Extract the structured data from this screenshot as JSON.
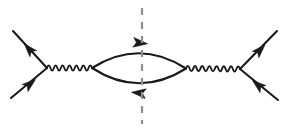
{
  "figure": {
    "width": 291,
    "height": 131,
    "background_color": "#ffffff",
    "line_color": "#1a1a1a",
    "cut_color": "#8f8f8f"
  },
  "chart_data": {
    "type": "diagram",
    "xlabel": "",
    "ylabel": "",
    "canvas": {
      "width": 291,
      "height": 131
    },
    "vertices": [
      {
        "name": "left-vertex",
        "x": 47,
        "y": 68
      },
      {
        "name": "bubble-left-vertex",
        "x": 92,
        "y": 68
      },
      {
        "name": "bubble-right-vertex",
        "x": 186,
        "y": 68.5
      },
      {
        "name": "right-vertex",
        "x": 240,
        "y": 69
      }
    ],
    "edges": [
      {
        "name": "incoming-fermion-lower-left",
        "style": "fermion",
        "from": [
          11,
          98
        ],
        "to": [
          47,
          68
        ],
        "arrow_direction": "toward-vertex",
        "arrow_at": [
          30,
          84
        ],
        "arrow_angle_deg": -39
      },
      {
        "name": "outgoing-fermion-upper-left",
        "style": "fermion",
        "from": [
          47,
          68
        ],
        "to": [
          13,
          31
        ],
        "arrow_direction": "away-from-vertex",
        "arrow_at": [
          29,
          49
        ],
        "arrow_angle_deg": -132
      },
      {
        "name": "boson-propagator-left",
        "style": "boson-wavy",
        "from": [
          47,
          68
        ],
        "to": [
          92,
          68
        ],
        "wavelength": 7.2,
        "amplitude": 2.6
      },
      {
        "name": "loop-fermion-upper",
        "style": "fermion-arc",
        "from": [
          92,
          68
        ],
        "to": [
          186,
          68.5
        ],
        "bulge": -30,
        "arrow_direction": "left-to-right",
        "arrow_at": [
          140,
          43
        ],
        "arrow_angle_deg": 6
      },
      {
        "name": "loop-fermion-lower",
        "style": "fermion-arc",
        "from": [
          92,
          68
        ],
        "to": [
          186,
          68.5
        ],
        "bulge": 30,
        "arrow_direction": "right-to-left",
        "arrow_at": [
          139,
          93
        ],
        "arrow_angle_deg": 186
      },
      {
        "name": "boson-propagator-right",
        "style": "boson-wavy",
        "from": [
          186,
          68.5
        ],
        "to": [
          240,
          69
        ],
        "wavelength": 7.2,
        "amplitude": 2.6
      },
      {
        "name": "outgoing-fermion-upper-right",
        "style": "fermion",
        "from": [
          240,
          69
        ],
        "to": [
          277,
          31
        ],
        "arrow_direction": "away-from-vertex",
        "arrow_at": [
          260,
          50
        ],
        "arrow_angle_deg": -46
      },
      {
        "name": "incoming-fermion-lower-right",
        "style": "fermion",
        "from": [
          278,
          100
        ],
        "to": [
          240,
          69
        ],
        "arrow_direction": "toward-vertex",
        "arrow_at": [
          258,
          85
        ],
        "arrow_angle_deg": -141
      }
    ],
    "cut": {
      "name": "cutkosky-cut",
      "style": "dashed-vertical",
      "x": 142,
      "y_start": 8,
      "y_end": 124,
      "dash_pattern": "7,7",
      "color": "#8f8f8f"
    }
  }
}
